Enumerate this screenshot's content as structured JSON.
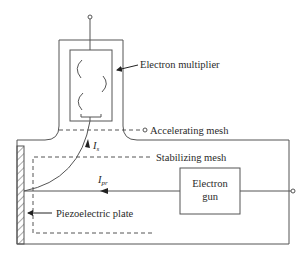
{
  "diagram": {
    "type": "schematic",
    "labels": {
      "electron_multiplier": "Electron multiplier",
      "accelerating_mesh": "Accelerating mesh",
      "stabilizing_mesh": "Stabilizing mesh",
      "electron_gun_line1": "Electron",
      "electron_gun_line2": "gun",
      "piezoelectric_plate": "Piezoelectric plate",
      "current_secondary_main": "I",
      "current_secondary_sub": "s",
      "current_primary_main": "I",
      "current_primary_sub": "pr"
    },
    "components": [
      {
        "name": "Electron multiplier",
        "shape": "rectangle with dynodes"
      },
      {
        "name": "Accelerating mesh",
        "shape": "dashed line with terminal"
      },
      {
        "name": "Stabilizing mesh",
        "shape": "dashed rectangle"
      },
      {
        "name": "Electron gun",
        "shape": "rectangle with terminal"
      },
      {
        "name": "Piezoelectric plate",
        "shape": "hatched bar"
      }
    ],
    "colors": {
      "line": "#555555",
      "text": "#2a2a2a",
      "background": "#ffffff"
    }
  }
}
